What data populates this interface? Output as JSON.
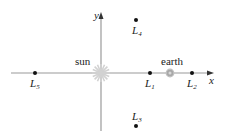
{
  "diagram": {
    "axes": {
      "x_label": "x",
      "y_label": "y",
      "axis_color": "#9a9a9a"
    },
    "bodies": {
      "sun": {
        "label": "sun",
        "color": "#c8c8c8"
      },
      "earth": {
        "label": "earth",
        "color": "#a0a0a0"
      }
    },
    "points": [
      {
        "id": "L1",
        "letter": "L",
        "sub": "1"
      },
      {
        "id": "L2",
        "letter": "L",
        "sub": "2"
      },
      {
        "id": "L3",
        "letter": "L",
        "sub": "3"
      },
      {
        "id": "L4",
        "letter": "L",
        "sub": "4"
      },
      {
        "id": "L5",
        "letter": "L",
        "sub": "5"
      }
    ],
    "point_color": "#111111"
  }
}
